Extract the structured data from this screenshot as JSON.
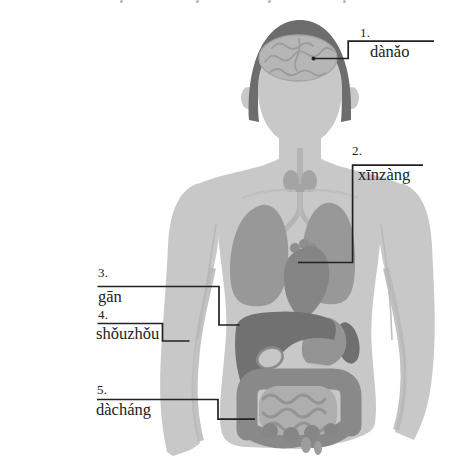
{
  "labels": [
    {
      "number": "1.",
      "term": "dànǎo"
    },
    {
      "number": "2.",
      "term": "xīnzàng"
    },
    {
      "number": "3.",
      "term": "gān"
    },
    {
      "number": "4.",
      "term": "shǒuzhǒu"
    },
    {
      "number": "5.",
      "term": "dàcháng"
    }
  ],
  "colors": {
    "background": "#ffffff",
    "ink": "#222222",
    "body": "#c8c8c8",
    "body-shade": "#b7b7b7",
    "hair": "#6d6d6d",
    "brain": "#b6b6b6",
    "brain-fold": "#9c9c9c",
    "lung": "#989898",
    "heart": "#858585",
    "liver": "#717171",
    "stomach": "#949494",
    "spleen": "#6f6f6f",
    "gallbladder": "#c6c6c6",
    "colon": "#898989",
    "small-intestine": "#aeaeae",
    "intestine-fold": "#949494",
    "thyroid": "#a4a4a4",
    "trachea": "#b4b4b4",
    "bone": "#bdbdbd"
  }
}
